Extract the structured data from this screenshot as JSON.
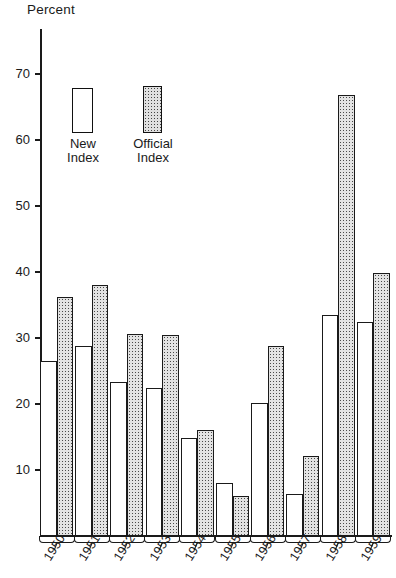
{
  "chart_data": {
    "type": "bar",
    "title": "Percent",
    "cut_off_header": "",
    "xlabel": "",
    "ylabel": "Percent",
    "ylim": [
      0,
      75
    ],
    "yticks": [
      10,
      20,
      30,
      40,
      50,
      60,
      70
    ],
    "grid": false,
    "legend_position": "inside-top-left",
    "categories": [
      "1950",
      "1951",
      "1952",
      "1953",
      "1954",
      "1955",
      "1956",
      "1957",
      "1958",
      "1959"
    ],
    "series": [
      {
        "name": "New Index",
        "values": [
          26.5,
          28.8,
          23.4,
          22.4,
          14.8,
          8.0,
          20.2,
          6.3,
          33.5,
          32.5
        ]
      },
      {
        "name": "Official Index",
        "values": [
          36.2,
          38.1,
          30.6,
          30.5,
          16.0,
          6.1,
          28.8,
          12.1,
          66.8,
          39.9
        ]
      }
    ]
  },
  "axis": {
    "title": "Percent",
    "tick_labels": [
      "70",
      "60",
      "50",
      "40",
      "30",
      "20",
      "10"
    ]
  },
  "legend": {
    "items": [
      {
        "key": "new",
        "label": "New\nIndex",
        "swatch": "white-box"
      },
      {
        "key": "official",
        "label": "Official\nIndex",
        "swatch": "stippled-box"
      }
    ]
  },
  "colors": {
    "ink": "#1a1a1a",
    "background": "#ffffff",
    "new_index_fill": "#ffffff",
    "official_index_fill": "#e3e3e3"
  }
}
